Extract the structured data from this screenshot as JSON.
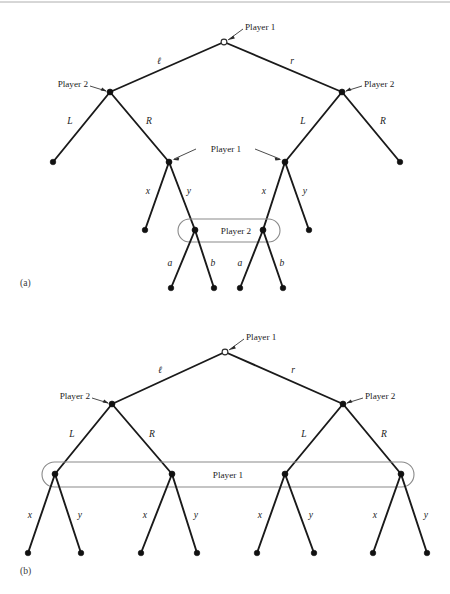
{
  "figure": {
    "panels": [
      {
        "id": "a",
        "caption": "(a)",
        "root_label": "Player 1",
        "root_actions": {
          "left": "ℓ",
          "right": "r"
        },
        "second_level_label_left": "Player 2",
        "second_level_label_right": "Player 2",
        "second_level_actions": {
          "left": "L",
          "right": "R"
        },
        "third_level_label": "Player 1",
        "third_level_actions": {
          "left": "x",
          "right": "y"
        },
        "infoset_label": "Player 2",
        "fourth_level_actions": {
          "left": "a",
          "right": "b"
        }
      },
      {
        "id": "b",
        "caption": "(b)",
        "root_label": "Player 1",
        "root_actions": {
          "left": "ℓ",
          "right": "r"
        },
        "second_level_label_left": "Player 2",
        "second_level_label_right": "Player 2",
        "second_level_actions": {
          "left": "L",
          "right": "R"
        },
        "infoset_label": "Player 1",
        "third_level_actions": {
          "left": "x",
          "right": "y"
        }
      }
    ],
    "colors": {
      "edge": "#1a1a1a",
      "node": "#111111",
      "infoset": "#8a8a8a",
      "text": "#1c1c1c",
      "background": "#ffffff"
    },
    "panel_a": {
      "labels": {
        "root_player": "Player 1",
        "left_player2": "Player 2",
        "right_player2": "Player 2",
        "mid_player1": "Player 1",
        "infoset_player2": "Player 2",
        "act_l": "ℓ",
        "act_r": "r",
        "act_L_left": "L",
        "act_R_left": "R",
        "act_L_right": "L",
        "act_R_right": "R",
        "act_x_left": "x",
        "act_y_left": "y",
        "act_x_right": "x",
        "act_y_right": "y",
        "act_a_left": "a",
        "act_b_left": "b",
        "act_a_right": "a",
        "act_b_right": "b",
        "caption": "(a)"
      }
    },
    "panel_b": {
      "labels": {
        "root_player": "Player 1",
        "left_player2": "Player 2",
        "right_player2": "Player 2",
        "infoset_player1": "Player 1",
        "act_l": "ℓ",
        "act_r": "r",
        "act_L_left": "L",
        "act_R_left": "R",
        "act_L_right": "L",
        "act_R_right": "R",
        "act_x_1": "x",
        "act_y_1": "y",
        "act_x_2": "x",
        "act_y_2": "y",
        "act_x_3": "x",
        "act_y_3": "y",
        "act_x_4": "x",
        "act_y_4": "y",
        "caption": "(b)"
      }
    }
  }
}
